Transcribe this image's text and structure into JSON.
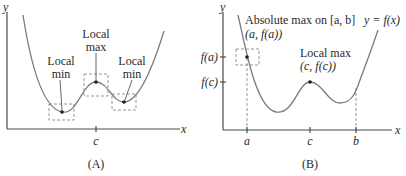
{
  "panels": [
    {
      "id": "A",
      "caption": "(A)",
      "axes": {
        "x_label": "x",
        "y_label": "y"
      },
      "x_ticks": [
        {
          "label": "c"
        }
      ],
      "annotations": [
        {
          "line1": "Local",
          "line2": "min"
        },
        {
          "line1": "Local",
          "line2": "max"
        },
        {
          "line1": "Local",
          "line2": "min"
        }
      ]
    },
    {
      "id": "B",
      "caption": "(B)",
      "axes": {
        "x_label": "x",
        "y_label": "y"
      },
      "function_label": "y = f(x)",
      "x_ticks": [
        {
          "label": "a"
        },
        {
          "label": "c"
        },
        {
          "label": "b"
        }
      ],
      "y_ticks": [
        {
          "label": "f(a)"
        },
        {
          "label": "f(c)"
        }
      ],
      "annotations": [
        {
          "line1": "Absolute max on [a, b]",
          "line2": "(a, f(a))"
        },
        {
          "line1": "Local max",
          "line2": "(c, f(c))"
        }
      ]
    }
  ]
}
